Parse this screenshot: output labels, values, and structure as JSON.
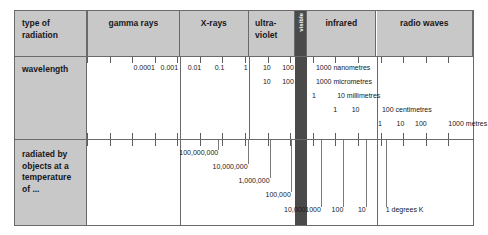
{
  "diagram": {
    "colors": {
      "label_background": "#c8c8c8",
      "border": "#6a6a6a",
      "visible_band": "#4a4a4a",
      "text": "#17171a"
    }
  },
  "rows": {
    "header_label": "type of\nradiation",
    "wavelength_label": "wavelength",
    "temperature_label": "radiated by\nobjects at a\ntemperature\nof ..."
  },
  "bands": [
    {
      "name": "gamma rays",
      "label": "gamma rays",
      "left": 0.0,
      "width": 24.0
    },
    {
      "name": "x-rays",
      "label": "X-rays",
      "left": 24.0,
      "width": 18.0
    },
    {
      "name": "ultraviolet",
      "label": "ultra-\nviolet",
      "left": 42.0,
      "width": 12.0
    },
    {
      "name": "visible",
      "label": "visible",
      "left": 54.0,
      "width": 3.0
    },
    {
      "name": "infrared",
      "label": "infrared",
      "left": 57.0,
      "width": 18.0
    },
    {
      "name": "radio waves",
      "label": "radio waves",
      "left": 75.0,
      "width": 25.0
    }
  ],
  "chart_data": {
    "type": "table",
    "scales": [
      {
        "name": "nanometres",
        "unit": "nanometres",
        "unit_label": "1000 nanometres",
        "values": [
          "0.0001",
          "0.001",
          "0.01",
          "0.1",
          "1",
          "10",
          "100",
          "1000"
        ]
      },
      {
        "name": "micrometres",
        "unit": "micrometres",
        "unit_label": "1000 micrometres",
        "values": [
          "10",
          "100",
          "1000"
        ]
      },
      {
        "name": "millimetres",
        "unit": "millimetres",
        "unit_label": "10 millimetres",
        "values": [
          "1",
          "10"
        ]
      },
      {
        "name": "centimetres",
        "unit": "centimetres",
        "unit_label": "100 centimetres",
        "values": [
          "1",
          "10",
          "100"
        ]
      },
      {
        "name": "metres",
        "unit": "metres",
        "unit_label": "1000 metres",
        "values": [
          "1",
          "10",
          "100",
          "1000"
        ]
      }
    ],
    "temperatures": {
      "unit": "degrees K",
      "unit_label": "1 degrees K",
      "values": [
        "100,000,000",
        "10,000,000",
        "1,000,000",
        "100,000",
        "10,000",
        "1000",
        "100",
        "10",
        "1"
      ]
    }
  },
  "wavelength_ticks": [
    {
      "label": "0.0001",
      "x": 17.6
    },
    {
      "label": "0.001",
      "x": 23.6
    },
    {
      "label": "0.01",
      "x": 29.6
    },
    {
      "label": "0.1",
      "x": 35.6
    },
    {
      "label": "1",
      "x": 41.6
    },
    {
      "label": "10",
      "x": 47.6
    },
    {
      "label": "100",
      "x": 53.6
    },
    {
      "label": "1000 nanometres",
      "x": 59.3
    }
  ],
  "micrometre_ticks": [
    {
      "label": "10",
      "x": 47.6
    },
    {
      "label": "100",
      "x": 53.6
    },
    {
      "label": "1000 micrometres",
      "x": 59.3
    }
  ],
  "millimetre_ticks": [
    {
      "label": "1",
      "x": 59.3
    },
    {
      "label": "10 millimetres",
      "x": 64.8
    }
  ],
  "centimetre_ticks": [
    {
      "label": "1",
      "x": 64.8
    },
    {
      "label": "10",
      "x": 70.6
    },
    {
      "label": "100 centimetres",
      "x": 76.4
    }
  ],
  "metre_ticks": [
    {
      "label": "1",
      "x": 76.4
    },
    {
      "label": "10",
      "x": 82.2
    },
    {
      "label": "100",
      "x": 88.0
    },
    {
      "label": "1000 metres",
      "x": 93.6
    }
  ],
  "temperature_ticks": [
    {
      "label": "100,000,000",
      "x": 34.0,
      "depth": 0
    },
    {
      "label": "10,000,000",
      "x": 41.6,
      "depth": 1
    },
    {
      "label": "1,000,000",
      "x": 47.3,
      "depth": 2
    },
    {
      "label": "100,000",
      "x": 52.8,
      "depth": 3
    },
    {
      "label": "10,000",
      "x": 56.6,
      "depth": 4
    },
    {
      "label": "1000",
      "x": 60.6,
      "depth": 4
    },
    {
      "label": "100",
      "x": 66.4,
      "depth": 4
    },
    {
      "label": "10",
      "x": 72.2,
      "depth": 4
    },
    {
      "label": "1 degrees K",
      "x": 77.4,
      "depth": 4
    }
  ]
}
